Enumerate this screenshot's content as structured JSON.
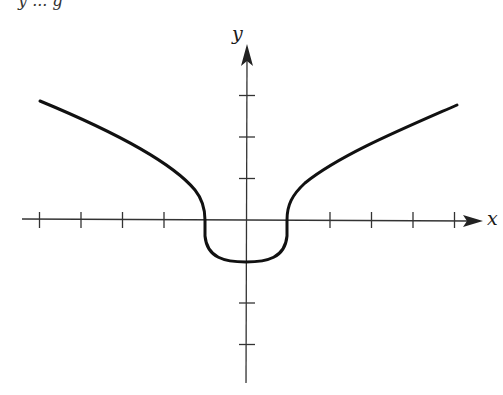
{
  "chart_data": {
    "type": "line",
    "title": "",
    "xlabel": "x",
    "ylabel": "y",
    "xlim": [
      -5.3,
      5.8
    ],
    "ylim": [
      -4,
      4.1
    ],
    "grid": false,
    "x_ticks": [
      -5,
      -4,
      -3,
      -2,
      2,
      3,
      4,
      5
    ],
    "y_ticks": [
      -3,
      -2,
      1,
      2,
      3
    ],
    "tick_labels_shown": false,
    "series": [
      {
        "name": "curve",
        "description": "Even function: for |x|>=1 rises like a root curve from (±1,0); for |x|<=1 a U-shaped arc with minimum (0,-1) and vertical tangents at x=±1",
        "points": [
          [
            -5,
            2.9
          ],
          [
            -4,
            2.35
          ],
          [
            -3,
            1.75
          ],
          [
            -2,
            1.1
          ],
          [
            -1.3,
            0.55
          ],
          [
            -1,
            0
          ],
          [
            -0.95,
            -0.45
          ],
          [
            -0.7,
            -0.8
          ],
          [
            -0.35,
            -0.97
          ],
          [
            0,
            -1
          ],
          [
            0.35,
            -0.97
          ],
          [
            0.7,
            -0.8
          ],
          [
            0.95,
            -0.45
          ],
          [
            1,
            0
          ],
          [
            1.3,
            0.55
          ],
          [
            2,
            1.1
          ],
          [
            3,
            1.75
          ],
          [
            4,
            2.3
          ],
          [
            5,
            2.8
          ]
        ]
      }
    ]
  },
  "labels": {
    "x_axis": "x",
    "y_axis": "y",
    "top_fragment": "y ... g"
  },
  "colors": {
    "curve": "#111111",
    "axis": "#333333"
  }
}
